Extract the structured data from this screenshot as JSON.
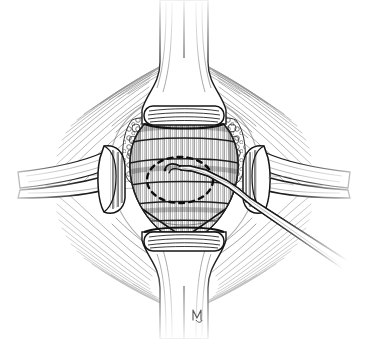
{
  "figure": {
    "panel_label": "D",
    "caption_text": "",
    "medium": "pen-and-ink line drawing",
    "background_color": "#ffffff",
    "ink_color": "#1a1a1a",
    "midtone_color": "#5a5a5a",
    "light_hatch_color": "#8c8c8c"
  },
  "artist_signature": {
    "name": "artist-monogram",
    "text": "",
    "x": 196,
    "y": 314
  },
  "structures": [
    {
      "id": "superior-spinous-process",
      "label": "Superior spinous process / lamina",
      "region": "top-center"
    },
    {
      "id": "superior-lamina-cut-edge",
      "label": "Cut edge of superior lamina",
      "region": "upper-center"
    },
    {
      "id": "inferior-spinous-process",
      "label": "Inferior spinous process / lamina",
      "region": "bottom-center"
    },
    {
      "id": "inferior-lamina-cut-edge",
      "label": "Cut edge of inferior lamina",
      "region": "lower-center"
    },
    {
      "id": "epidural-fat-left",
      "label": "Epidural fat",
      "region": "upper-left-of-canal"
    },
    {
      "id": "epidural-fat-right",
      "label": "Epidural fat",
      "region": "upper-right-of-canal"
    },
    {
      "id": "dural-sac",
      "label": "Dural sac / thecal sac",
      "region": "center"
    },
    {
      "id": "annulus-fibrosus",
      "label": "Annulus fibrosus of intervertebral disc",
      "region": "center"
    },
    {
      "id": "annulotomy-outline",
      "label": "Dashed annulotomy incision outline",
      "region": "center",
      "style": "dashed oval"
    },
    {
      "id": "paraspinal-muscle",
      "label": "Paraspinal muscle (radiating hatching)",
      "region": "surrounding"
    }
  ],
  "instruments": [
    {
      "id": "retractor-left",
      "label": "Left nerve root retractor blade",
      "region": "left"
    },
    {
      "id": "retractor-right",
      "label": "Right nerve root retractor blade",
      "region": "right"
    },
    {
      "id": "nerve-hook-probe",
      "label": "Nerve hook / probe",
      "region": "lower-right diagonal"
    }
  ]
}
